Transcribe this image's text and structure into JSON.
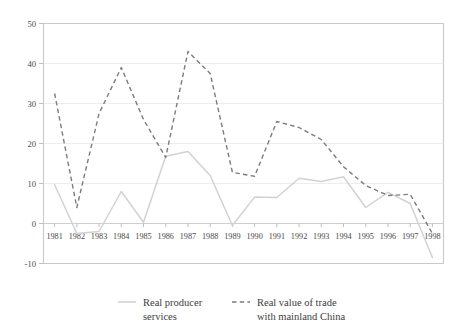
{
  "chart_data": {
    "type": "line",
    "title": "",
    "subtitle": "",
    "xlabel": "",
    "ylabel": "",
    "categories": [
      "1981",
      "1982",
      "1983",
      "1984",
      "1985",
      "1986",
      "1987",
      "1988",
      "1989",
      "1990",
      "1991",
      "1992",
      "1993",
      "1994",
      "1995",
      "1996",
      "1997",
      "1998"
    ],
    "xlim": [
      "1981",
      "1998"
    ],
    "ylim": [
      -10,
      50
    ],
    "yticks": [
      -10,
      0,
      10,
      20,
      30,
      40,
      50
    ],
    "ytick_labels": [
      "-10",
      "0",
      "10",
      "20",
      "30",
      "40",
      "50"
    ],
    "grid": true,
    "legend_position": "bottom",
    "series": [
      {
        "name": "Real producer services",
        "style": "solid",
        "color": "#d2d2d2",
        "values": [
          9.7,
          -2.5,
          -2.0,
          8.0,
          0.3,
          16.8,
          18.0,
          12.0,
          -0.5,
          6.6,
          6.5,
          11.3,
          10.5,
          11.7,
          4.0,
          7.8,
          5.0,
          -8.5
        ]
      },
      {
        "name": "Real value of trade with mainland China",
        "style": "dashed",
        "color": "#7c7c7c",
        "values": [
          32.5,
          4.0,
          27.5,
          39.0,
          26.0,
          16.5,
          43.0,
          37.5,
          12.8,
          11.8,
          25.5,
          24.0,
          21.0,
          14.2,
          9.5,
          7.0,
          7.3,
          -2.5
        ]
      }
    ],
    "legend": [
      {
        "label_line1": "Real producer",
        "label_line2": "services",
        "style": "solid"
      },
      {
        "label_line1": "Real value of trade",
        "label_line2": "with mainland China",
        "style": "dashed"
      }
    ],
    "colors": {
      "producer_services": "#d2d2d2",
      "trade_mainland_china": "#7c7c7c",
      "frame": "#c9c9c9",
      "grid": "#e8e8e8",
      "text": "#3d3d3d",
      "background": "#ffffff"
    }
  }
}
